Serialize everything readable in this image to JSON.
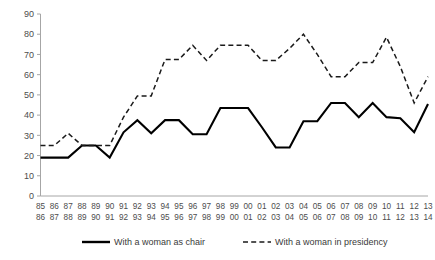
{
  "chart_data": {
    "type": "line",
    "title": "",
    "xlabel": "",
    "ylabel": "",
    "ylim": [
      0,
      90
    ],
    "yticks": [
      0,
      10,
      20,
      30,
      40,
      50,
      60,
      70,
      80,
      90
    ],
    "grid": false,
    "legend_position": "bottom",
    "categories": [
      "85/86",
      "86/87",
      "87/88",
      "88/89",
      "89/90",
      "90/91",
      "91/92",
      "92/93",
      "93/94",
      "94/95",
      "95/96",
      "96/97",
      "97/98",
      "98/99",
      "99/00",
      "00/01",
      "01/02",
      "02/03",
      "03/04",
      "04/05",
      "05/06",
      "06/07",
      "07/08",
      "08/09",
      "09/10",
      "10/11",
      "11/12",
      "12/13",
      "13/14"
    ],
    "categories_top": [
      "85",
      "86",
      "87",
      "88",
      "89",
      "90",
      "91",
      "92",
      "93",
      "94",
      "95",
      "96",
      "97",
      "98",
      "99",
      "00",
      "01",
      "02",
      "03",
      "04",
      "05",
      "06",
      "07",
      "08",
      "09",
      "10",
      "11",
      "12",
      "13"
    ],
    "categories_bottom": [
      "86",
      "87",
      "88",
      "89",
      "90",
      "91",
      "92",
      "93",
      "94",
      "95",
      "96",
      "97",
      "98",
      "99",
      "00",
      "01",
      "02",
      "03",
      "04",
      "05",
      "06",
      "07",
      "08",
      "09",
      "10",
      "11",
      "12",
      "13",
      "14"
    ],
    "series": [
      {
        "name": "With a woman as chair",
        "style": "solid",
        "color": "#000000",
        "values": [
          19,
          19,
          19,
          25,
          25,
          19,
          31.5,
          37.5,
          31,
          37.5,
          37.5,
          30.5,
          30.5,
          43.5,
          43.5,
          43.5,
          34,
          24,
          24,
          37,
          37,
          46,
          46,
          39,
          46,
          39,
          38.5,
          31.5,
          45.5
        ]
      },
      {
        "name": "With a woman in presidency",
        "style": "dashed",
        "color": "#1a1a1a",
        "values": [
          25,
          25,
          31,
          25,
          25,
          25,
          39,
          49.5,
          49.5,
          67.5,
          67.5,
          74.5,
          67,
          74.5,
          74.5,
          74.5,
          67,
          67,
          73,
          80,
          70,
          59,
          59,
          66,
          66,
          78.5,
          64,
          46,
          59
        ]
      }
    ],
    "legend": [
      {
        "label": "With a woman as chair",
        "style": "solid"
      },
      {
        "label": "With a woman in presidency",
        "style": "dashed"
      }
    ]
  }
}
